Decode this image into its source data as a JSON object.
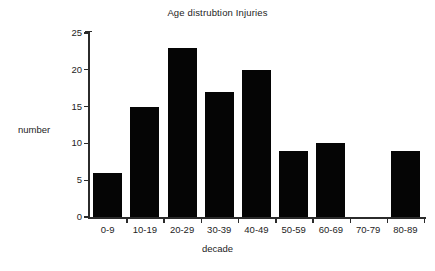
{
  "chart_data": {
    "type": "bar",
    "title": "Age distrubtion Injuries",
    "xlabel": "decade",
    "ylabel": "number",
    "categories": [
      "0-9",
      "10-19",
      "20-29",
      "30-39",
      "40-49",
      "50-59",
      "60-69",
      "70-79",
      "80-89"
    ],
    "values": [
      6,
      15,
      23,
      17,
      20,
      9,
      10,
      0,
      9
    ],
    "ylim": [
      0,
      25
    ],
    "yticks": [
      0,
      5,
      10,
      15,
      20,
      25
    ],
    "ytick_labels": [
      "0",
      "5",
      "10",
      "15",
      "20",
      "25"
    ],
    "grid": false,
    "legend": null,
    "bar_color": "#050505",
    "axis_color": "#2b2b2b",
    "background_color": "#ffffff"
  }
}
